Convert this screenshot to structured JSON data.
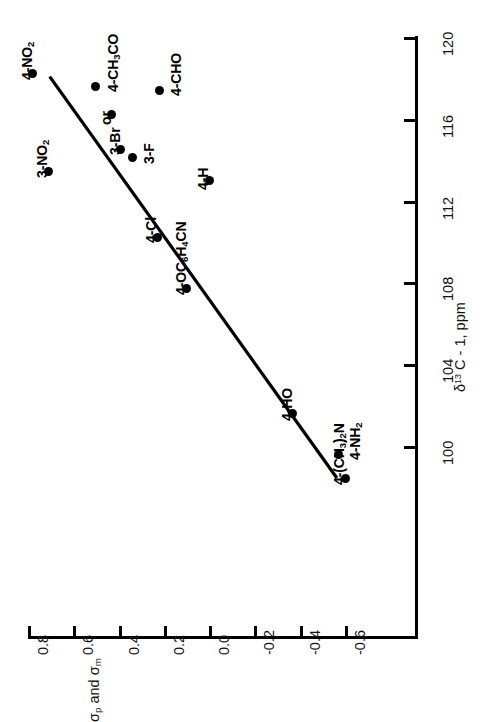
{
  "chart_data": {
    "type": "scatter",
    "title": "",
    "orientation": "rotated-90-ccw",
    "xlabel": "δ¹³ C - 1, ppm",
    "ylabel": "σp and σm",
    "xlabel_parts": {
      "delta": "δ",
      "sup": "13",
      "rest": " C - 1, ppm"
    },
    "ylabel_parts": {
      "sigma1": "σ",
      "sub1": "p",
      "mid": " and ",
      "sigma2": "σ",
      "sub2": "m"
    },
    "xlim": [
      98,
      121
    ],
    "ylim": [
      -0.68,
      0.86
    ],
    "xticks": [
      100,
      104,
      108,
      112,
      116,
      120
    ],
    "xticklabels": [
      "100",
      "104",
      "108",
      "112",
      "116",
      "120"
    ],
    "yticks": [
      0.8,
      0.6,
      0.4,
      0.2,
      0.0,
      -0.2,
      -0.4,
      -0.6
    ],
    "yticklabels": [
      "0.8",
      "0.6",
      "0.4",
      "0.2",
      "0.0",
      "-0.2",
      "-0.4",
      "-0.6"
    ],
    "grid": false,
    "legend": false,
    "fit_line": {
      "x": [
        98.5,
        118.0
      ],
      "y": [
        -0.56,
        0.7
      ],
      "label": "least-squares line"
    },
    "points": [
      {
        "label": "4-NO2",
        "label_html": "4-NO<sub>2</sub>",
        "x": 118.2,
        "y": 0.78
      },
      {
        "label": "3-NO2",
        "label_html": "3-NO<sub>2</sub>",
        "x": 113.4,
        "y": 0.71
      },
      {
        "label": "4-CH3CO",
        "label_html": "4-CH<sub>3</sub>CO",
        "x": 117.6,
        "y": 0.5
      },
      {
        "label": "or",
        "label_html": "or",
        "x": 116.2,
        "y": 0.43
      },
      {
        "label": "4-CHO",
        "label_html": "4-CHO",
        "x": 117.4,
        "y": 0.22
      },
      {
        "label": "3-Br",
        "label_html": "3-Br",
        "x": 114.5,
        "y": 0.39
      },
      {
        "label": "3-F",
        "label_html": "3-F",
        "x": 114.1,
        "y": 0.34
      },
      {
        "label": "4-H",
        "label_html": "4-H",
        "x": 113.0,
        "y": 0.0
      },
      {
        "label": "4-Cl",
        "label_html": "4-Cl",
        "x": 110.2,
        "y": 0.23
      },
      {
        "label": "4-OC6H4CN",
        "label_html": "4-OC<sub>6</sub>H<sub>4</sub>CN",
        "x": 107.7,
        "y": 0.1
      },
      {
        "label": "4-HO",
        "label_html": "4-HO",
        "x": 101.6,
        "y": -0.37
      },
      {
        "label": "4-NH2",
        "label_html": "4-NH<sub>2</sub>",
        "x": 99.6,
        "y": -0.57
      },
      {
        "label": "4-(CH3)2N",
        "label_html": "4-(CH<sub>3</sub>)<sub>2</sub>N",
        "x": 98.4,
        "y": -0.6
      }
    ]
  },
  "axes": {
    "sigma": {
      "title_html": "σ<sub>p</sub> and σ<sub>m</sub>",
      "ticks": [
        {
          "value": 0.8,
          "label": "0.8"
        },
        {
          "value": 0.6,
          "label": "0.6"
        },
        {
          "value": 0.4,
          "label": "0.4"
        },
        {
          "value": 0.2,
          "label": "0.2"
        },
        {
          "value": 0.0,
          "label": "0.0"
        },
        {
          "value": -0.2,
          "label": "-0.2"
        },
        {
          "value": -0.4,
          "label": "-0.4"
        },
        {
          "value": -0.6,
          "label": "-0.6"
        }
      ]
    },
    "delta": {
      "title_html": "δ<sup>13</sup> C - 1, ppm",
      "ticks": [
        {
          "value": 120,
          "label": "120"
        },
        {
          "value": 116,
          "label": "116"
        },
        {
          "value": 112,
          "label": "112"
        },
        {
          "value": 108,
          "label": "108"
        },
        {
          "value": 104,
          "label": "104"
        },
        {
          "value": 100,
          "label": "100"
        }
      ]
    }
  },
  "colors": {
    "ink": "#000000",
    "background": "#ffffff"
  }
}
